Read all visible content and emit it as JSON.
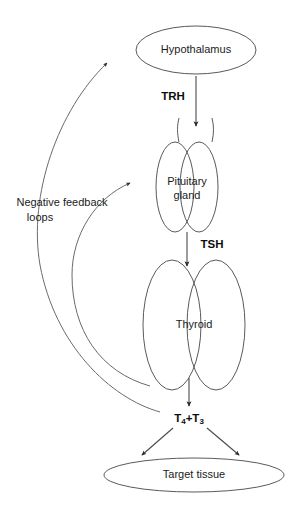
{
  "diagram": {
    "background_color": "#ffffff",
    "outline_color": "#5a5a5a",
    "arrow_color": "#2b2b2b",
    "nodes": {
      "hypothalamus": {
        "label": "Hypothalamus",
        "shape": "ellipse"
      },
      "pituitary": {
        "label_line1": "Pituitary",
        "label_line2": "gland",
        "shape": "double-ellipse"
      },
      "thyroid": {
        "label": "Thyroid",
        "shape": "butterfly-double-ellipse"
      },
      "target_tissue": {
        "label": "Target tissue",
        "shape": "ellipse"
      }
    },
    "hormones": {
      "trh": "TRH",
      "tsh": "TSH",
      "thyroid_hormones": {
        "t4_letter": "T",
        "t4_sub": "4",
        "plus": "+",
        "t3_letter": "T",
        "t3_sub": "3"
      }
    },
    "feedback": {
      "label_line1": "Negative feedback",
      "label_line2": "loops",
      "loop_count": 2
    }
  }
}
